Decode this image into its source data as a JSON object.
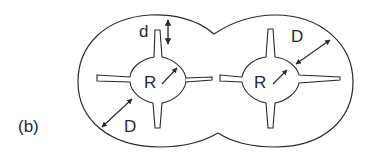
{
  "figure": {
    "panel_label": "(b)",
    "labels": {
      "gap_d": "d",
      "radius_left": "R",
      "radius_right": "R",
      "distance_left": "D",
      "distance_right": "D"
    },
    "colors": {
      "stroke": "#2a2a2a",
      "background": "#ffffff"
    }
  }
}
